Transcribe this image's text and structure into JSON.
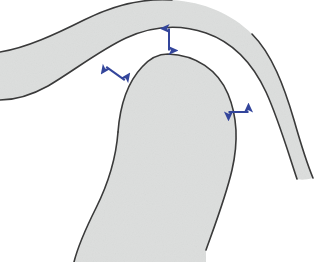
{
  "figure": {
    "background_color": "#ffffff",
    "outline_color": "#3a3a3a",
    "fill_color": "#dcdedd",
    "arrow_color": "#33459b",
    "outline_width": 1.6,
    "caption_fragment": "",
    "regions": [
      {
        "name": "overlying-band",
        "label": "Overlying curved tissue band",
        "fill": "#dcdedd",
        "stroke": "#3a3a3a"
      },
      {
        "name": "central-dome",
        "label": "Central dome-shaped structure",
        "fill": "#dcdedd",
        "stroke": "#3a3a3a"
      }
    ],
    "arrows": [
      {
        "name": "arrow-top-gap",
        "label": "Superior gap measurement",
        "orientation": "vertical",
        "double_headed": true,
        "x1": 169,
        "y1": 27,
        "x2": 169,
        "y2": 52,
        "color": "#33459b"
      },
      {
        "name": "arrow-left-gap",
        "label": "Superolateral gap measurement",
        "orientation": "diagonal",
        "double_headed": true,
        "x1": 105,
        "y1": 66,
        "x2": 126,
        "y2": 81,
        "color": "#33459b"
      },
      {
        "name": "arrow-right-gap",
        "label": "Lateral gap measurement",
        "orientation": "horizontal",
        "double_headed": true,
        "x1": 227,
        "y1": 112,
        "x2": 250,
        "y2": 112,
        "color": "#33459b"
      }
    ]
  }
}
